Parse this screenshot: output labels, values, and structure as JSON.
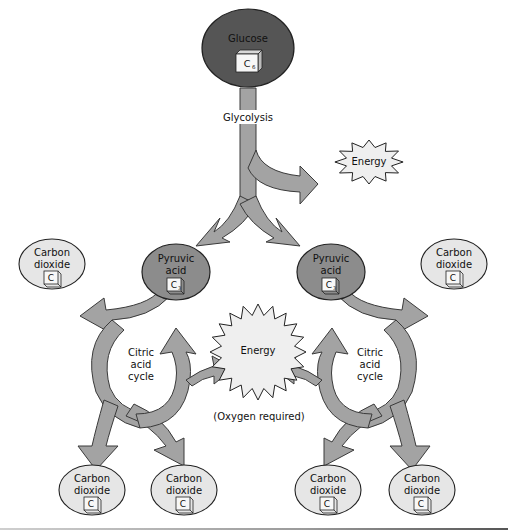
{
  "colors": {
    "glucose_fill": "#555555",
    "pyruvic_fill": "#8c8c8c",
    "co2_fill": "#e6e6e6",
    "energy_fill": "#efefef",
    "arrow_fill": "#a3a3a3",
    "outline": "#222222"
  },
  "glucose": {
    "label": "Glucose",
    "carbon": "C",
    "subscript": "6"
  },
  "glycolysis": {
    "label": "Glycolysis"
  },
  "energy_top": {
    "label": "Energy"
  },
  "energy_center": {
    "label": "Energy",
    "note": "(Oxygen required)"
  },
  "pyruvic": [
    {
      "label_line1": "Pyruvic",
      "label_line2": "acid",
      "carbon": "C",
      "subscript": "3"
    },
    {
      "label_line1": "Pyruvic",
      "label_line2": "acid",
      "carbon": "C",
      "subscript": "3"
    }
  ],
  "citric_cycle": [
    {
      "line1": "Citric",
      "line2": "acid",
      "line3": "cycle"
    },
    {
      "line1": "Citric",
      "line2": "acid",
      "line3": "cycle"
    }
  ],
  "carbon_dioxide": [
    {
      "line1": "Carbon",
      "line2": "dioxide",
      "carbon": "C"
    },
    {
      "line1": "Carbon",
      "line2": "dioxide",
      "carbon": "C"
    },
    {
      "line1": "Carbon",
      "line2": "dioxide",
      "carbon": "C"
    },
    {
      "line1": "Carbon",
      "line2": "dioxide",
      "carbon": "C"
    },
    {
      "line1": "Carbon",
      "line2": "dioxide",
      "carbon": "C"
    },
    {
      "line1": "Carbon",
      "line2": "dioxide",
      "carbon": "C"
    }
  ]
}
